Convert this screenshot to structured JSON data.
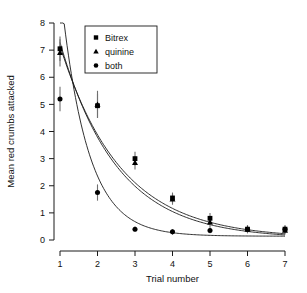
{
  "chart_data": {
    "type": "scatter",
    "title": "",
    "xlabel": "Trial number",
    "ylabel": "Mean red crumbs attacked",
    "xlim": [
      1,
      7
    ],
    "ylim": [
      0,
      8
    ],
    "grid": false,
    "legend_position": "top-center",
    "xticks": [
      "1",
      "2",
      "3",
      "4",
      "5",
      "6",
      "7"
    ],
    "yticks": [
      "0",
      "1",
      "2",
      "3",
      "4",
      "5",
      "6",
      "7",
      "8"
    ],
    "x": [
      1,
      2,
      3,
      4,
      5,
      6,
      7
    ],
    "series": [
      {
        "name": "Bitrex",
        "marker": "square",
        "values": [
          7.05,
          4.95,
          3.0,
          1.55,
          0.8,
          0.4,
          0.4
        ],
        "err_low": [
          0.45,
          0.45,
          0.25,
          0.2,
          0.2,
          0.15,
          0.15
        ],
        "err_high": [
          0.45,
          0.45,
          0.25,
          0.2,
          0.2,
          0.15,
          0.15
        ],
        "fit": {
          "a": 13.2,
          "k": 0.62,
          "c": 0.06
        }
      },
      {
        "name": "quinine",
        "marker": "triangle",
        "values": [
          6.9,
          5.0,
          2.85,
          1.5,
          0.65,
          0.4,
          0.35
        ],
        "err_low": [
          0.5,
          0.5,
          0.25,
          0.2,
          0.2,
          0.15,
          0.15
        ],
        "err_high": [
          0.5,
          0.5,
          0.25,
          0.2,
          0.2,
          0.15,
          0.15
        ],
        "fit": {
          "a": 14.0,
          "k": 0.66,
          "c": 0.05
        }
      },
      {
        "name": "both",
        "marker": "circle",
        "values": [
          5.2,
          1.75,
          0.4,
          0.3,
          0.35,
          0.4,
          0.4
        ],
        "err_low": [
          0.45,
          0.3,
          0.1,
          0.1,
          0.1,
          0.1,
          0.1
        ],
        "err_high": [
          0.45,
          0.3,
          0.1,
          0.1,
          0.1,
          0.1,
          0.1
        ],
        "fit": {
          "a": 38.0,
          "k": 1.42,
          "c": 0.14
        }
      }
    ],
    "colors": {
      "marker": "#000000",
      "errorbar": "#6f6f6f",
      "curve": "#1a1a1a",
      "axis": "#1a1a1a",
      "background": "#ffffff"
    }
  },
  "legend": {
    "items": [
      {
        "label": "Bitrex",
        "marker": "square"
      },
      {
        "label": "quinine",
        "marker": "triangle"
      },
      {
        "label": "both",
        "marker": "circle"
      }
    ]
  }
}
